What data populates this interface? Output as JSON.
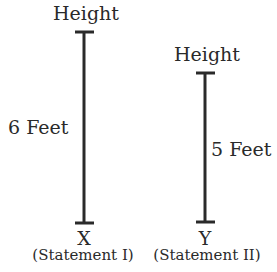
{
  "diagram": {
    "left": {
      "top_label": "Height",
      "measure_label": "6 Feet",
      "name": "X",
      "caption": "(Statement I)",
      "height_ft": 6
    },
    "right": {
      "top_label": "Height",
      "measure_label": "5 Feet",
      "name": "Y",
      "caption": "(Statement II)",
      "height_ft": 5
    },
    "line_color": "#2a2a2a"
  }
}
